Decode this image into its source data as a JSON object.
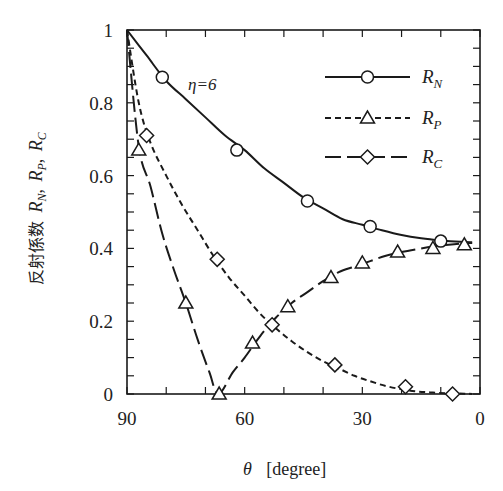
{
  "chart_data": {
    "type": "line",
    "title": "",
    "annotation": "η=6",
    "xlabel": "θ  [degree]",
    "ylabel": "反射係数 R_N, R_P, R_C",
    "xlim": [
      90,
      0
    ],
    "ylim": [
      0,
      1
    ],
    "x_reversed": true,
    "xticks": [
      90,
      60,
      30,
      0
    ],
    "xtick_labels": [
      "90",
      "60",
      "30",
      "0"
    ],
    "yticks": [
      0,
      0.2,
      0.4,
      0.6,
      0.8,
      1
    ],
    "ytick_labels": [
      "0",
      "0.2",
      "0.4",
      "0.6",
      "0.8",
      "1"
    ],
    "x_minor_step": 10,
    "y_minor_step": 0.05,
    "grid": false,
    "legend_position": "upper right (inside)",
    "legend": [
      {
        "name": "R_N",
        "main": "R",
        "sub": "N",
        "line": "solid",
        "marker": "circle"
      },
      {
        "name": "R_P",
        "main": "R",
        "sub": "P",
        "line": "short-dash",
        "marker": "triangle"
      },
      {
        "name": "R_C",
        "main": "R",
        "sub": "C",
        "line": "long-dash",
        "marker": "diamond"
      }
    ],
    "series": [
      {
        "name": "R_N",
        "line": "solid",
        "marker": "circle",
        "curve_x": [
          90,
          85,
          80,
          75,
          70,
          65,
          60,
          55,
          50,
          45,
          40,
          35,
          30,
          25,
          20,
          15,
          10,
          5,
          2
        ],
        "curve_y": [
          1.0,
          0.93,
          0.86,
          0.81,
          0.76,
          0.71,
          0.67,
          0.62,
          0.58,
          0.54,
          0.51,
          0.48,
          0.465,
          0.45,
          0.437,
          0.428,
          0.422,
          0.418,
          0.417
        ],
        "marker_x": [
          81,
          62,
          44,
          28,
          10
        ],
        "marker_y": [
          0.87,
          0.67,
          0.53,
          0.46,
          0.42
        ]
      },
      {
        "name": "R_P (drawn long-dash with triangle markers, dips to 0 at Brewster angle)",
        "line": "long-dash",
        "marker": "triangle",
        "curve_x": [
          90,
          87,
          84,
          81,
          78,
          75,
          72,
          69,
          66.7,
          63,
          60,
          56,
          52,
          48,
          44,
          40,
          36,
          32,
          28,
          24,
          20,
          16,
          12,
          8,
          4,
          2
        ],
        "curve_y": [
          1.0,
          0.68,
          0.57,
          0.44,
          0.34,
          0.25,
          0.15,
          0.06,
          0.0,
          0.06,
          0.1,
          0.16,
          0.21,
          0.25,
          0.28,
          0.31,
          0.335,
          0.35,
          0.365,
          0.38,
          0.39,
          0.398,
          0.405,
          0.41,
          0.414,
          0.415
        ],
        "marker_x": [
          87,
          75,
          66.5,
          58,
          49,
          38,
          30,
          21,
          12,
          4
        ],
        "marker_y": [
          0.67,
          0.25,
          0.0,
          0.14,
          0.24,
          0.32,
          0.36,
          0.39,
          0.4,
          0.41
        ]
      },
      {
        "name": "R_C (drawn short-dash with diamond markers)",
        "line": "short-dash",
        "marker": "diamond",
        "curve_x": [
          90,
          87,
          84,
          80,
          76,
          72,
          68,
          64,
          60,
          56,
          52,
          48,
          44,
          40,
          36,
          32,
          28,
          24,
          20,
          16,
          12,
          8,
          4,
          2
        ],
        "curve_y": [
          1.0,
          0.8,
          0.69,
          0.6,
          0.52,
          0.45,
          0.38,
          0.32,
          0.27,
          0.22,
          0.18,
          0.145,
          0.115,
          0.09,
          0.07,
          0.05,
          0.035,
          0.022,
          0.013,
          0.007,
          0.004,
          0.002,
          0.001,
          0.0
        ],
        "marker_x": [
          85,
          67,
          53,
          37,
          19,
          7
        ],
        "marker_y": [
          0.71,
          0.37,
          0.19,
          0.08,
          0.02,
          0.0
        ]
      }
    ]
  },
  "labels": {
    "annotation": "η=6",
    "ylabel_cjk": "反射係数",
    "xlabel_theta": "θ",
    "xlabel_unit": "[degree]"
  },
  "style": {
    "line_color": "#1a1a1a",
    "marker_fill": "#ffffff",
    "background": "#ffffff"
  }
}
